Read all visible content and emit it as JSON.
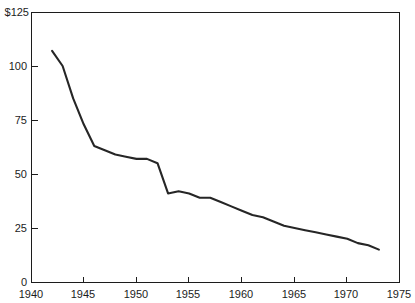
{
  "chart_data": {
    "type": "line",
    "title": "",
    "subtitle": "",
    "xlabel": "",
    "ylabel": "",
    "xlim": [
      1940,
      1975
    ],
    "ylim": [
      0,
      125
    ],
    "grid": false,
    "legend": "none",
    "x_ticks": [
      "1940",
      "1945",
      "1950",
      "1955",
      "1960",
      "1965",
      "1970",
      "1975"
    ],
    "x_tick_values": [
      1940,
      1945,
      1950,
      1955,
      1960,
      1965,
      1970,
      1975
    ],
    "y_ticks": [
      "0",
      "25",
      "50",
      "75",
      "100",
      "$125"
    ],
    "y_tick_values": [
      0,
      25,
      50,
      75,
      100,
      125
    ],
    "y_axis_currency_prefix": "$",
    "series": [
      {
        "name": "value",
        "x": [
          1942,
          1943,
          1944,
          1945,
          1946,
          1947,
          1948,
          1949,
          1950,
          1951,
          1952,
          1953,
          1954,
          1955,
          1956,
          1957,
          1958,
          1959,
          1960,
          1961,
          1962,
          1963,
          1964,
          1965,
          1966,
          1967,
          1968,
          1969,
          1970,
          1971,
          1972,
          1973
        ],
        "values": [
          107,
          100,
          85,
          73,
          63,
          61,
          59,
          58,
          57,
          57,
          55,
          41,
          42,
          41,
          39,
          39,
          37,
          35,
          33,
          31,
          30,
          28,
          26,
          25,
          24,
          23,
          22,
          21,
          20,
          18,
          17,
          15
        ]
      }
    ]
  },
  "plot": {
    "left": 31,
    "right": 400,
    "top": 12,
    "bottom": 282
  },
  "labels": {
    "y0": "0",
    "y25": "25",
    "y50": "50",
    "y75": "75",
    "y100": "100",
    "y125": "$125",
    "x1940": "1940",
    "x1945": "1945",
    "x1950": "1950",
    "x1955": "1955",
    "x1960": "1960",
    "x1965": "1965",
    "x1970": "1970",
    "x1975": "1975"
  },
  "colors": {
    "line": "#262626",
    "axis": "#1c1c1c",
    "background": "#ffffff",
    "text": "#1c1c1c"
  }
}
